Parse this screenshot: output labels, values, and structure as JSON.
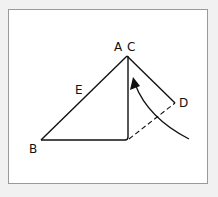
{
  "diagram": {
    "labels": {
      "A": "A",
      "C": "C",
      "E": "E",
      "B": "B",
      "D": "D"
    },
    "colors": {
      "stroke": "#111111",
      "frame": "#9a9a9a",
      "background": "#f1f1f1",
      "panel": "#ffffff"
    }
  }
}
